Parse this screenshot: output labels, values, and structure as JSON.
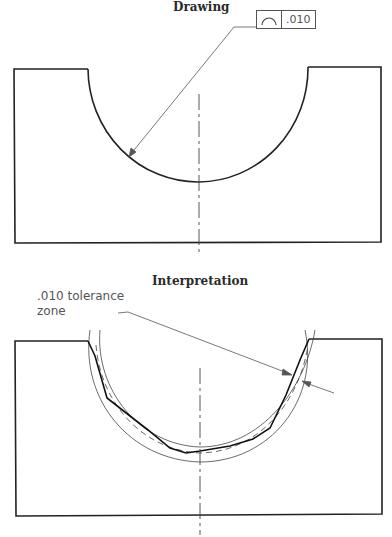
{
  "drawing": {
    "title": "Drawing",
    "feature_control_frame": {
      "symbol": "profile-of-a-line-icon",
      "tolerance": ".010"
    }
  },
  "interpretation": {
    "title": "Interpretation",
    "note_line1": ".010  tolerance",
    "note_line2": "zone"
  },
  "colors": {
    "outline": "#222222",
    "leader": "#555555"
  }
}
